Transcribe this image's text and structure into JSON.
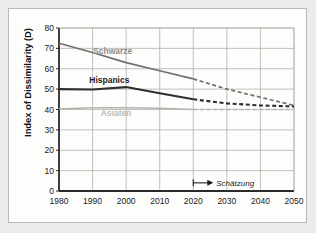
{
  "chart_data": {
    "type": "line",
    "title": "",
    "xlabel": "",
    "ylabel": "Index of Dissimilarity (D)",
    "xlim": [
      1980,
      2050
    ],
    "ylim": [
      0,
      80
    ],
    "yticks": [
      0,
      10,
      20,
      30,
      40,
      50,
      60,
      70,
      80
    ],
    "xticks": [
      1980,
      1990,
      2000,
      2010,
      2020,
      2030,
      2040,
      2050
    ],
    "grid": true,
    "legend_position": "inline-labels",
    "annotations": [
      {
        "text": "Schätzung",
        "x": 2020,
        "y": 4,
        "marker": "arrow-right"
      }
    ],
    "series": [
      {
        "name": "Schwarze",
        "color": "#6f6f6c",
        "label_x": 1996,
        "label_y": 67,
        "x": [
          1980,
          1990,
          2000,
          2010,
          2020
        ],
        "values": [
          72.5,
          68.0,
          63.0,
          59.0,
          55.0
        ],
        "projection_x": [
          2020,
          2030,
          2040,
          2050
        ],
        "projection_values": [
          55.0,
          50.0,
          46.0,
          42.0
        ],
        "projection_style": "dashed"
      },
      {
        "name": "Hispanics",
        "color": "#2e2e2e",
        "label_x": 1995,
        "label_y": 53,
        "x": [
          1980,
          1990,
          2000,
          2010,
          2020
        ],
        "values": [
          50.0,
          49.8,
          51.0,
          48.0,
          45.0
        ],
        "projection_x": [
          2020,
          2030,
          2040,
          2050
        ],
        "projection_values": [
          45.0,
          43.0,
          42.0,
          41.5
        ],
        "projection_style": "dashed"
      },
      {
        "name": "Asiaten",
        "color": "#b3b3b0",
        "label_x": 1997,
        "label_y": 37,
        "x": [
          1980,
          1990,
          2000,
          2010,
          2020
        ],
        "values": [
          40.2,
          40.8,
          40.8,
          40.6,
          40.0
        ],
        "projection_x": [
          2020,
          2030,
          2040,
          2050
        ],
        "projection_values": [
          40.0,
          40.0,
          40.0,
          40.0
        ],
        "projection_style": "dashed"
      }
    ]
  },
  "axis": {
    "y_label": "Index of Dissimilarity (D)",
    "y_tick_labels": [
      "80",
      "70",
      "60",
      "50",
      "40",
      "30",
      "20",
      "10",
      "0"
    ],
    "x_tick_labels": [
      "1980",
      "1990",
      "2000",
      "2010",
      "2020",
      "2030",
      "2040",
      "2050"
    ]
  },
  "labels": {
    "schwarze": "Schwarze",
    "hispanics": "Hispanics",
    "asiaten": "Asiaten",
    "schaetzung": "Schätzung"
  },
  "colors": {
    "background": "#ececeb",
    "card": "#fdfdfc",
    "border": "#b9b9b6",
    "grid": "#b0b0ad",
    "axis": "#2a2a2a",
    "schwarze": "#6f6f6c",
    "hispanics": "#2e2e2e",
    "asiaten": "#b3b3b0"
  }
}
